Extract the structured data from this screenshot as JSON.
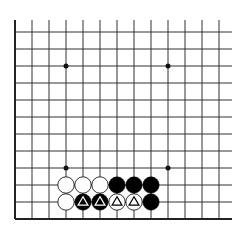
{
  "board": {
    "background": "#ffffff",
    "line_color": "#333333",
    "edge_color": "#222222",
    "visible_edges": [
      "left",
      "bottom"
    ],
    "columns": 13,
    "rows": 12,
    "origin_x": 15,
    "spacing": 17,
    "bottom_y": 219,
    "top_extent_y": 20,
    "right_extent_x": 232,
    "star_points": [
      {
        "col": 3,
        "row_from_bottom": 9
      },
      {
        "col": 9,
        "row_from_bottom": 9
      },
      {
        "col": 3,
        "row_from_bottom": 3
      },
      {
        "col": 9,
        "row_from_bottom": 3
      }
    ],
    "stones": [
      {
        "col": 3,
        "row_from_bottom": 2,
        "color": "white",
        "mark": ""
      },
      {
        "col": 4,
        "row_from_bottom": 2,
        "color": "white",
        "mark": ""
      },
      {
        "col": 5,
        "row_from_bottom": 2,
        "color": "white",
        "mark": ""
      },
      {
        "col": 6,
        "row_from_bottom": 2,
        "color": "black",
        "mark": ""
      },
      {
        "col": 7,
        "row_from_bottom": 2,
        "color": "black",
        "mark": ""
      },
      {
        "col": 8,
        "row_from_bottom": 2,
        "color": "black",
        "mark": ""
      },
      {
        "col": 3,
        "row_from_bottom": 1,
        "color": "white",
        "mark": ""
      },
      {
        "col": 4,
        "row_from_bottom": 1,
        "color": "black",
        "mark": "triangle"
      },
      {
        "col": 5,
        "row_from_bottom": 1,
        "color": "black",
        "mark": "triangle"
      },
      {
        "col": 6,
        "row_from_bottom": 1,
        "color": "white",
        "mark": "triangle"
      },
      {
        "col": 7,
        "row_from_bottom": 1,
        "color": "white",
        "mark": "triangle"
      },
      {
        "col": 8,
        "row_from_bottom": 1,
        "color": "black",
        "mark": ""
      }
    ]
  }
}
